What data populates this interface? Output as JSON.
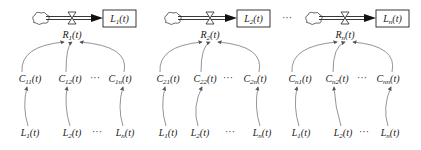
{
  "diagram": {
    "type": "system-dynamics-stock-flow",
    "panels": [
      {
        "id": 1,
        "stock": {
          "base": "L",
          "sub": "1",
          "arg": "(t)"
        },
        "rate": {
          "base": "R",
          "sub": "1",
          "arg": "(t)"
        },
        "converters": [
          {
            "base": "C",
            "sub": "11",
            "arg": "(t)"
          },
          {
            "base": "C",
            "sub": "12",
            "arg": "(t)"
          },
          {
            "base": "C",
            "sub": "1n",
            "arg": "(t)"
          }
        ],
        "inputs": [
          {
            "base": "L",
            "sub": "1",
            "arg": "(t)"
          },
          {
            "base": "L",
            "sub": "2",
            "arg": "(t)"
          },
          {
            "base": "L",
            "sub": "n",
            "arg": "(t)"
          }
        ]
      },
      {
        "id": 2,
        "stock": {
          "base": "L",
          "sub": "2",
          "arg": "(t)"
        },
        "rate": {
          "base": "R",
          "sub": "2",
          "arg": "(t)"
        },
        "converters": [
          {
            "base": "C",
            "sub": "21",
            "arg": "(t)"
          },
          {
            "base": "C",
            "sub": "22",
            "arg": "(t)"
          },
          {
            "base": "C",
            "sub": "2n",
            "arg": "(t)"
          }
        ],
        "inputs": [
          {
            "base": "L",
            "sub": "1",
            "arg": "(t)"
          },
          {
            "base": "L",
            "sub": "2",
            "arg": "(t)"
          },
          {
            "base": "L",
            "sub": "n",
            "arg": "(t)"
          }
        ]
      },
      {
        "id": 3,
        "stock": {
          "base": "L",
          "sub": "n",
          "arg": "(t)"
        },
        "rate": {
          "base": "R",
          "sub": "n",
          "arg": "(t)"
        },
        "converters": [
          {
            "base": "C",
            "sub": "n1",
            "arg": "(t)"
          },
          {
            "base": "C",
            "sub": "n2",
            "arg": "(t)"
          },
          {
            "base": "C",
            "sub": "nn",
            "arg": "(t)"
          }
        ],
        "inputs": [
          {
            "base": "L",
            "sub": "1",
            "arg": "(t)"
          },
          {
            "base": "L",
            "sub": "2",
            "arg": "(t)"
          },
          {
            "base": "L",
            "sub": "n",
            "arg": "(t)"
          }
        ]
      }
    ],
    "ellipsis": "···",
    "colors": {
      "line": "#222222",
      "arrow": "#555555",
      "text": "#222222"
    }
  }
}
